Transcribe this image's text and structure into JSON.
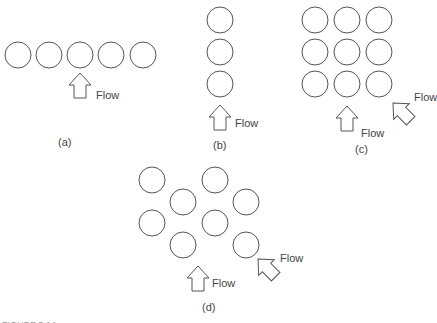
{
  "figure": {
    "panels": [
      {
        "id": "a",
        "caption": "(a)",
        "arrangement": "single row, in-line",
        "tubes": [
          [
            18,
            55
          ],
          [
            49,
            55
          ],
          [
            80,
            55
          ],
          [
            111,
            55
          ],
          [
            143,
            55
          ]
        ],
        "flow_label": "Flow",
        "arrows": [
          {
            "type": "up",
            "x": 80,
            "y": 73
          }
        ]
      },
      {
        "id": "b",
        "caption": "(b)",
        "arrangement": "single column, in-line",
        "tubes": [
          [
            220,
            20
          ],
          [
            220,
            52
          ],
          [
            220,
            84
          ]
        ],
        "flow_label": "Flow",
        "arrows": [
          {
            "type": "up",
            "x": 220,
            "y": 105
          }
        ]
      },
      {
        "id": "c",
        "caption": "(c)",
        "arrangement": "square in-line bank",
        "tubes": [
          [
            315,
            20
          ],
          [
            347,
            20
          ],
          [
            379,
            20
          ],
          [
            315,
            52
          ],
          [
            347,
            52
          ],
          [
            379,
            52
          ],
          [
            315,
            84
          ],
          [
            347,
            84
          ],
          [
            379,
            84
          ]
        ],
        "flow_label_up": "Flow",
        "flow_label_diag": "Flow",
        "arrows": [
          {
            "type": "up",
            "x": 347,
            "y": 106
          },
          {
            "type": "diag",
            "x": 393,
            "y": 103
          }
        ]
      },
      {
        "id": "d",
        "caption": "(d)",
        "arrangement": "staggered bank",
        "tubes": [
          [
            152,
            180
          ],
          [
            215,
            180
          ],
          [
            183,
            202
          ],
          [
            246,
            202
          ],
          [
            152,
            223
          ],
          [
            215,
            223
          ],
          [
            183,
            245
          ],
          [
            246,
            245
          ]
        ],
        "flow_label_up": "Flow",
        "flow_label_diag": "Flow",
        "arrows": [
          {
            "type": "up",
            "x": 198,
            "y": 266
          },
          {
            "type": "diag",
            "x": 258,
            "y": 259
          }
        ]
      }
    ],
    "tube_radius": 13,
    "cropped_caption": "FIGURE 5.14"
  }
}
